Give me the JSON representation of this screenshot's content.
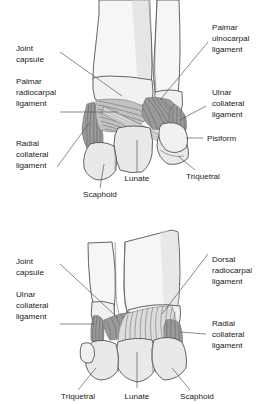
{
  "figures": [
    {
      "id": "palmar-view",
      "view_name": "palmar-wrist-ligaments",
      "labels": {
        "joint_capsule": "Joint\ncapsule",
        "joint_capsule_l1": "Joint",
        "joint_capsule_l2": "capsule",
        "palmar_radiocarpal_l1": "Palmar",
        "palmar_radiocarpal_l2": "radiocarpal",
        "palmar_radiocarpal_l3": "ligament",
        "radial_collateral_l1": "Radial",
        "radial_collateral_l2": "collateral",
        "radial_collateral_l3": "ligament",
        "palmar_ulnocarpal_l1": "Palmar",
        "palmar_ulnocarpal_l2": "ulnocarpal",
        "palmar_ulnocarpal_l3": "ligament",
        "ulnar_collateral_l1": "Ulnar",
        "ulnar_collateral_l2": "collateral",
        "ulnar_collateral_l3": "ligament",
        "pisiform": "Pisiform",
        "triquetral": "Triquetral",
        "lunate": "Lunate",
        "scaphoid": "Scaphoid"
      }
    },
    {
      "id": "dorsal-view",
      "view_name": "dorsal-wrist-ligaments",
      "labels": {
        "joint_capsule_l1": "Joint",
        "joint_capsule_l2": "capsule",
        "ulnar_collateral_l1": "Ulnar",
        "ulnar_collateral_l2": "collateral",
        "ulnar_collateral_l3": "ligament",
        "dorsal_radiocarpal_l1": "Dorsal",
        "dorsal_radiocarpal_l2": "radiocarpal",
        "dorsal_radiocarpal_l3": "ligament",
        "radial_collateral_l1": "Radial",
        "radial_collateral_l2": "collateral",
        "radial_collateral_l3": "ligament",
        "triquetral": "Triquetral",
        "lunate": "Lunate",
        "scaphoid": "Scaphoid"
      }
    }
  ],
  "colors": {
    "background": "#ffffff",
    "text": "#1a1a1a",
    "leader_line": "#58595b",
    "bone_fill": "#f1f1f1",
    "bone_outline": "#4a4a4a",
    "ligament_dark": "#9a9a9a",
    "ligament_mid": "#c2c2c2",
    "ligament_light": "#dcdcdc",
    "fiber": "#555555"
  }
}
